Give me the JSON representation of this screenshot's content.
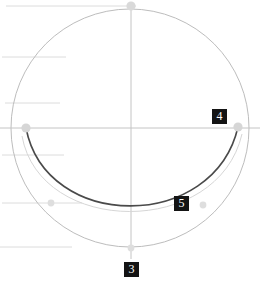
{
  "diagram": {
    "title": "",
    "background_color": "#ffffff",
    "width": 260,
    "height": 287,
    "colors": {
      "circle_stroke": "#b9b9b9",
      "axis_stroke": "#bdbdbd",
      "guide_stroke": "#dcdcdc",
      "curve_stroke": "#4a4a4a",
      "faint_curve_stroke": "#cfcfcf",
      "handle_fill": "#d8d8d8",
      "badge_bg": "#141414",
      "badge_text": "#ffffff"
    },
    "circle": {
      "name": "construction-circle",
      "center_x": 130,
      "center_y": 128,
      "radius": 119
    },
    "axes": {
      "vertical": {
        "x": 131,
        "y1": 6,
        "y2": 259
      },
      "horizontal": {
        "y": 128,
        "x1": 0,
        "x2": 260
      }
    },
    "guide_lines": [
      {
        "y": 6,
        "x1": 6,
        "x2": 136
      },
      {
        "y": 57,
        "x1": 2,
        "x2": 66
      },
      {
        "y": 103,
        "x1": 5,
        "x2": 60
      },
      {
        "y": 128,
        "x1": 0,
        "x2": 260
      },
      {
        "y": 155,
        "x1": 2,
        "x2": 64
      },
      {
        "y": 203,
        "x1": 2,
        "x2": 82
      },
      {
        "y": 247,
        "x1": 0,
        "x2": 72
      }
    ],
    "curve": {
      "name": "catenary-arc",
      "start": {
        "x": 26,
        "y": 128
      },
      "control_1": {
        "x": 46,
        "y": 232
      },
      "control_2": {
        "x": 214,
        "y": 232
      },
      "end": {
        "x": 238,
        "y": 127
      }
    },
    "handles": [
      {
        "name": "handle-top",
        "x": 131,
        "y": 6,
        "r": 4.5
      },
      {
        "name": "handle-left",
        "x": 26,
        "y": 128,
        "r": 4.5
      },
      {
        "name": "handle-right",
        "x": 238,
        "y": 127,
        "r": 4.5
      },
      {
        "name": "handle-lower-left",
        "x": 51,
        "y": 203,
        "r": 3.5
      },
      {
        "name": "handle-lower-right",
        "x": 203,
        "y": 205,
        "r": 3.5
      },
      {
        "name": "handle-bottom",
        "x": 131,
        "y": 248,
        "r": 3.5
      }
    ],
    "badges": [
      {
        "id": "badge-4",
        "label": "4",
        "x": 212,
        "y": 109
      },
      {
        "id": "badge-5",
        "label": "5",
        "x": 174,
        "y": 196
      },
      {
        "id": "badge-3",
        "label": "3",
        "x": 124,
        "y": 262
      }
    ]
  }
}
